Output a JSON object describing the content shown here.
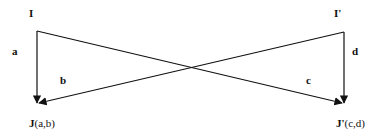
{
  "diagram": {
    "nodes": {
      "I": {
        "label": "I"
      },
      "I_prime": {
        "label": "I'"
      },
      "J": {
        "label_bold": "J",
        "label_rest": "(a,b)"
      },
      "J_prime": {
        "label_bold": "J'",
        "label_rest": "(c,d)"
      }
    },
    "edges": {
      "a": {
        "label": "a",
        "from": "I",
        "to": "J"
      },
      "b": {
        "label": "b",
        "from": "I'",
        "to": "J"
      },
      "c": {
        "label": "c",
        "from": "I",
        "to": "J'"
      },
      "d": {
        "label": "d",
        "from": "I'",
        "to": "J'"
      }
    },
    "stroke_color": "#111111"
  }
}
